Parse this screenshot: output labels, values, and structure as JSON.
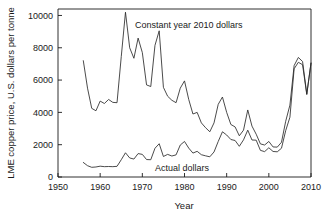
{
  "chart_data": {
    "type": "line",
    "title": "",
    "xlabel": "Year",
    "ylabel": "LME copper price, U.S. dollars per tonne",
    "xlim": [
      1950,
      2010
    ],
    "ylim": [
      0,
      10400
    ],
    "xticks": [
      1950,
      1960,
      1970,
      1980,
      1990,
      2000,
      2010
    ],
    "xtick_labels": [
      "1950",
      "1960",
      "1970",
      "1980",
      "1990",
      "2000",
      "2010"
    ],
    "yticks": [
      0,
      2000,
      4000,
      6000,
      8000,
      10000
    ],
    "ytick_labels": [
      "0",
      "2000",
      "4000",
      "6000",
      "8000",
      "10000"
    ],
    "grid": false,
    "legend_position": "inline-annotation",
    "line_color": "#2b2b2b",
    "background_color": "#ffffff",
    "x": [
      1956,
      1957,
      1958,
      1959,
      1960,
      1961,
      1962,
      1963,
      1964,
      1965,
      1966,
      1967,
      1968,
      1969,
      1970,
      1971,
      1972,
      1973,
      1974,
      1975,
      1976,
      1977,
      1978,
      1979,
      1980,
      1981,
      1982,
      1983,
      1984,
      1985,
      1986,
      1987,
      1988,
      1989,
      1990,
      1991,
      1992,
      1993,
      1994,
      1995,
      1996,
      1997,
      1998,
      1999,
      2000,
      2001,
      2002,
      2003,
      2004,
      2005,
      2006,
      2007,
      2008,
      2009,
      2010
    ],
    "series": [
      {
        "name": "Constant year 2010 dollars",
        "annotation": "Constant year 2010 dollars",
        "values": [
          7200,
          5500,
          4250,
          4100,
          4700,
          4550,
          4800,
          4620,
          4600,
          7450,
          10200,
          8000,
          7350,
          8600,
          7700,
          5700,
          5600,
          8150,
          9050,
          5550,
          5000,
          4750,
          4600,
          5500,
          5950,
          4800,
          3900,
          4000,
          3350,
          3050,
          2800,
          3350,
          4500,
          4950,
          4000,
          3250,
          3100,
          2550,
          2900,
          4150,
          3150,
          2650,
          2050,
          1980,
          2200,
          1860,
          1850,
          2150,
          3450,
          4450,
          6900,
          7400,
          7150,
          5150,
          7050
        ]
      },
      {
        "name": "Actual dollars",
        "annotation": "Actual dollars",
        "values": [
          900,
          700,
          600,
          620,
          670,
          640,
          650,
          640,
          660,
          1070,
          1500,
          1180,
          1110,
          1450,
          1400,
          1080,
          1070,
          1780,
          2060,
          1270,
          1400,
          1300,
          1370,
          1980,
          2200,
          1790,
          1480,
          1590,
          1380,
          1310,
          1250,
          1550,
          2200,
          2800,
          2600,
          2320,
          2260,
          1900,
          2300,
          2900,
          2290,
          2280,
          1650,
          1570,
          1810,
          1580,
          1560,
          1780,
          2870,
          3700,
          6700,
          7100,
          6950,
          5100,
          7050
        ]
      }
    ]
  },
  "annotations": {
    "constant_label": "Constant year 2010 dollars",
    "actual_label": "Actual dollars"
  }
}
